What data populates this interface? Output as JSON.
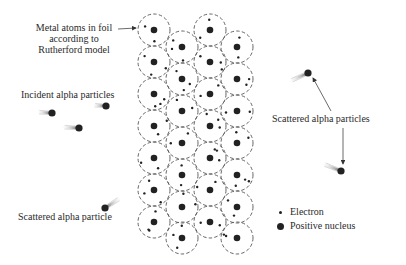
{
  "labels": {
    "metal_atoms": [
      "Metal atoms in foil",
      "according to",
      "Rutherford model"
    ],
    "incident": "Incident alpha particles",
    "scattered_right": "Scattered alpha particles",
    "scattered_left": "Scattered alpha particle"
  },
  "legend": {
    "electron": "Electron",
    "nucleus": "Positive nucleus"
  },
  "colors": {
    "ink": "#222222",
    "dash": "#555555",
    "trail": "#9a9a9a",
    "background": "#ffffff"
  },
  "atom_grid": {
    "radius": 16,
    "columns": [
      {
        "x": 154,
        "ys": [
          30,
          62,
          94,
          126,
          158,
          190,
          222
        ]
      },
      {
        "x": 182,
        "ys": [
          47,
          79,
          111,
          143,
          175,
          207,
          238
        ]
      },
      {
        "x": 210,
        "ys": [
          30,
          62,
          94,
          126,
          158,
          190,
          222
        ]
      },
      {
        "x": 237,
        "ys": [
          47,
          79,
          111,
          143,
          175,
          207,
          238
        ]
      }
    ]
  },
  "alpha_particles": [
    {
      "role": "incident",
      "x": 52,
      "y": 113,
      "tx": 36,
      "ty": 112
    },
    {
      "role": "incident",
      "x": 106,
      "y": 106,
      "tx": 92,
      "ty": 105
    },
    {
      "role": "incident",
      "x": 79,
      "y": 128,
      "tx": 61,
      "ty": 127
    },
    {
      "role": "scattered",
      "x": 308,
      "y": 73,
      "tx": 288,
      "ty": 82
    },
    {
      "role": "scattered",
      "x": 341,
      "y": 171,
      "tx": 321,
      "ty": 163
    },
    {
      "role": "scattered",
      "x": 105,
      "y": 208,
      "tx": 122,
      "ty": 197
    }
  ],
  "arrows": [
    {
      "from": [
        118,
        29
      ],
      "to": [
        136,
        28
      ]
    },
    {
      "from": [
        331,
        111
      ],
      "to": [
        313,
        78
      ]
    },
    {
      "from": [
        343,
        128
      ],
      "to": [
        343,
        164
      ]
    }
  ]
}
